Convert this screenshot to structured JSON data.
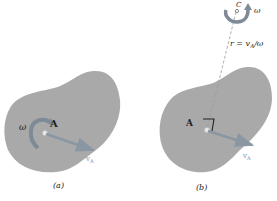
{
  "figure": {
    "panel_a": {
      "caption": "(a)",
      "point_label": "A",
      "omega_label": "ω",
      "velocity_label": "v",
      "velocity_subscript": "A"
    },
    "panel_b": {
      "caption": "(b)",
      "point_label": "A",
      "center_label": "C",
      "omega_label": "ω",
      "radius_label": "r = v",
      "radius_subscript": "A",
      "radius_suffix": "/ω",
      "velocity_label": "v",
      "velocity_subscript": "A"
    },
    "colors": {
      "body_fill": "#a9a9a9",
      "arrow": "#8a96a2",
      "velocity_text": "#7b93ad",
      "dashed_line": "#9a9a9a",
      "background": "#ffffff"
    }
  }
}
